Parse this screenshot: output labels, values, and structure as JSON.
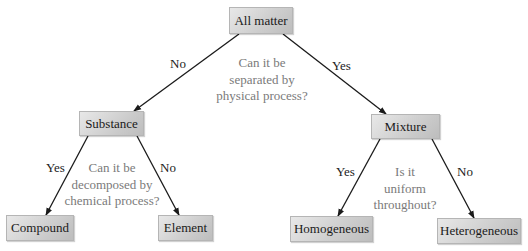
{
  "diagram": {
    "type": "decision-tree",
    "nodes": {
      "root": {
        "label": "All matter"
      },
      "substance": {
        "label": "Substance"
      },
      "mixture": {
        "label": "Mixture"
      },
      "compound": {
        "label": "Compound"
      },
      "element": {
        "label": "Element"
      },
      "homogeneous": {
        "label": "Homogeneous"
      },
      "heterogeneous": {
        "label": "Heterogeneous"
      }
    },
    "questions": {
      "root": {
        "lines": [
          "Can it be",
          "separated by",
          "physical process?"
        ]
      },
      "substance": {
        "lines": [
          "Can it be",
          "decomposed by",
          "chemical process?"
        ]
      },
      "mixture": {
        "lines": [
          "Is it",
          "uniform",
          "throughout?"
        ]
      }
    },
    "edges": {
      "root_to_substance": {
        "label": "No"
      },
      "root_to_mixture": {
        "label": "Yes"
      },
      "substance_to_compound": {
        "label": "Yes"
      },
      "substance_to_element": {
        "label": "No"
      },
      "mixture_to_homogeneous": {
        "label": "Yes"
      },
      "mixture_to_heterogeneous": {
        "label": "No"
      }
    },
    "colors": {
      "node_fill": "#cfcfcf",
      "edge": "#1a1a1a",
      "question_text": "#7a7a7a"
    }
  }
}
